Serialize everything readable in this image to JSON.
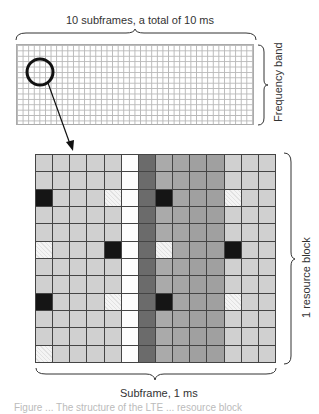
{
  "diagram": {
    "top_label": "10 subframes, a total of 10 ms",
    "side_label_top": "Frequency band",
    "side_label_main": "1 resource block",
    "bottom_label": "Subframe, 1 ms",
    "caption_partial": "Figure ... The structure of the LTE ... resource block",
    "mini_grid": {
      "columns": 42,
      "rows": 15
    },
    "resource_grid": {
      "columns": 14,
      "rows": 12,
      "column_types": [
        "light",
        "light",
        "light",
        "light",
        "light",
        "white",
        "dark",
        "mid1",
        "mid2",
        "mid3",
        "mid3",
        "light",
        "light",
        "light"
      ],
      "special_cells": [
        {
          "row": 2,
          "col": 0,
          "type": "black"
        },
        {
          "row": 2,
          "col": 4,
          "type": "hatch"
        },
        {
          "row": 2,
          "col": 7,
          "type": "black"
        },
        {
          "row": 2,
          "col": 11,
          "type": "hatch"
        },
        {
          "row": 5,
          "col": 0,
          "type": "hatch"
        },
        {
          "row": 5,
          "col": 4,
          "type": "black"
        },
        {
          "row": 5,
          "col": 7,
          "type": "hatch"
        },
        {
          "row": 5,
          "col": 11,
          "type": "black"
        },
        {
          "row": 8,
          "col": 0,
          "type": "black"
        },
        {
          "row": 8,
          "col": 4,
          "type": "hatch"
        },
        {
          "row": 8,
          "col": 7,
          "type": "black"
        },
        {
          "row": 8,
          "col": 11,
          "type": "hatch"
        },
        {
          "row": 11,
          "col": 0,
          "type": "hatch"
        }
      ]
    },
    "colors": {
      "light": "#d0d0d0",
      "white": "#fdfdfd",
      "dark": "#6b6b6b",
      "mid": "#a6a6a6",
      "black": "#151515",
      "grid_line": "#444444"
    }
  }
}
